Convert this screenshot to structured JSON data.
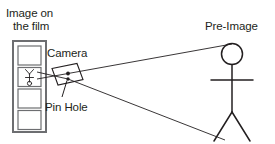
{
  "diagram": {
    "labels": {
      "film_line1": "Image on",
      "film_line2": "the film",
      "camera": "Camera",
      "pin_hole": "Pin Hole",
      "pre_image": "Pre-Image"
    },
    "colors": {
      "stroke": "#231f20",
      "film_border": "#6d6e71",
      "background": "#ffffff",
      "pinhole_dot": "#231f20"
    },
    "film": {
      "frame_count": 4,
      "frames_with_image": [
        2
      ],
      "image_orientation": "inverted"
    },
    "rays": {
      "count": 2,
      "from": "pre-image subject",
      "through": "pin hole",
      "to": "film"
    }
  }
}
